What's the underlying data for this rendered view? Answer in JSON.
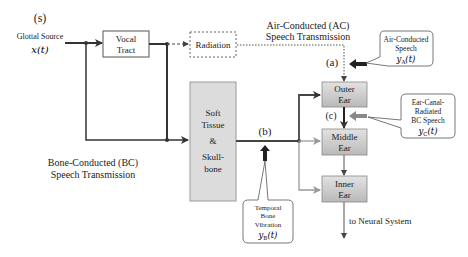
{
  "diagram": {
    "source": {
      "label_marker": "(s)",
      "title": "Glottal Source",
      "signal": "x(t)"
    },
    "blocks": {
      "vocal_tract": [
        "Vocal",
        "Tract"
      ],
      "radiation": "Radiation",
      "soft_tissue": [
        "Soft",
        "Tissue",
        "&",
        "Skull-",
        "bone"
      ],
      "outer_ear": [
        "Outer",
        "Ear"
      ],
      "middle_ear": [
        "Middle",
        "Ear"
      ],
      "inner_ear": [
        "Inner",
        "Ear"
      ]
    },
    "paths": {
      "air_conducted": [
        "Air-Conducted (AC)",
        "Speech Transmission"
      ],
      "bone_conducted": [
        "Bone-Conducted (BC)",
        "Speech Transmission"
      ],
      "output": "to Neural System"
    },
    "points": {
      "a": "(a)",
      "b": "(b)",
      "c": "(c)"
    },
    "callouts": {
      "air_conducted_speech": {
        "lines": [
          "Air-Conducted",
          "Speech"
        ],
        "signal": "y_A(t)",
        "signal_base": "y",
        "signal_sub": "A",
        "signal_arg": "(t)"
      },
      "ear_canal_bc": {
        "lines": [
          "Ear-Canal-",
          "Radiated",
          "BC Speech"
        ],
        "signal_base": "y",
        "signal_sub": "C",
        "signal_arg": "(t)"
      },
      "temporal_bone": {
        "lines": [
          "Temporal",
          "Bone",
          "Vibration"
        ],
        "signal_base": "y",
        "signal_sub": "B",
        "signal_arg": "(t)"
      }
    },
    "colors": {
      "line_dark": "#333333",
      "line_gray": "#999999",
      "box_fill": "#d6d6d6",
      "ear_box_fill": "#c8c8c8",
      "probe_arrow": "#444444",
      "probe_arrow_gray": "#888888"
    }
  }
}
